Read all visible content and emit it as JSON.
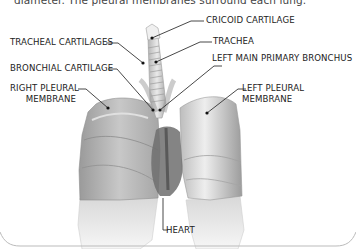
{
  "caption": "diameter. The pleural membranes surround each lung.",
  "labels": {
    "cricoid": "CRICOID CARTILAGE",
    "tracheal_cartilages": "TRACHEAL CARTILAGES",
    "trachea": "TRACHEA",
    "bronchial_cartilage": "BRONCHIAL CARTILAGE",
    "left_main_bronchus": "LEFT MAIN PRIMARY BRONCHUS",
    "right_pleural_1": "RIGHT PLEURAL",
    "right_pleural_2": "MEMBRANE",
    "left_pleural_1": "LEFT PLEURAL",
    "left_pleural_2": "MEMBRANE",
    "heart": "HEART"
  },
  "colors": {
    "text": "#222222",
    "line": "#333333",
    "lung_dark": "#8a8a8a",
    "lung_light": "#e6e6e6"
  }
}
